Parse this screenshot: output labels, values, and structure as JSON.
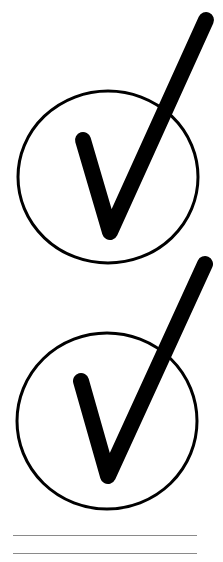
{
  "page": {
    "background": "#ffffff",
    "ink_color": "#000000",
    "line_color": "#8a8a8a"
  },
  "icons": [
    {
      "name": "circled-checkmark-1",
      "type": "checkmark-in-circle"
    },
    {
      "name": "circled-checkmark-2",
      "type": "checkmark-in-circle"
    }
  ],
  "writing_lines": {
    "count": 2
  }
}
